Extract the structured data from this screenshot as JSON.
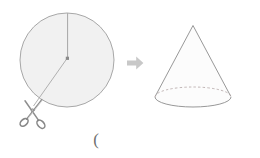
{
  "diagram": {
    "background_color": "#ffffff",
    "caption_mark": "(",
    "left_shape": {
      "name": "circle",
      "label": "",
      "center": [
        67,
        60
      ],
      "radius": 47,
      "fill_color": "#f2f2f2",
      "stroke_color": "#9a9a9a",
      "center_dot_color": "#8c8c8c",
      "radius_line_label": "",
      "cut_line_label": ""
    },
    "tool": {
      "name": "scissors",
      "position": [
        33,
        112
      ],
      "stroke_color": "#8a8a8a",
      "fill_color": "#d8d8d8"
    },
    "transform_arrow": {
      "name": "right-arrow",
      "direction": "right",
      "color": "#c9c9c9",
      "position": [
        127,
        57
      ]
    },
    "right_shape": {
      "name": "cone",
      "label": "",
      "apex": [
        193,
        25
      ],
      "base_center": [
        193,
        97
      ],
      "base_rx": 38,
      "base_ry": 10,
      "stroke_color": "#8e8e8e",
      "hidden_edge_style": "dashed",
      "fill_color": "#fcfcfc"
    }
  }
}
